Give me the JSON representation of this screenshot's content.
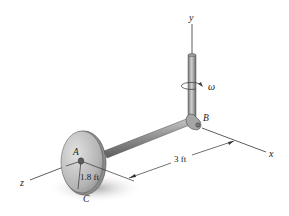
{
  "figure": {
    "type": "mechanics-diagram",
    "axes": {
      "x_label": "x",
      "y_label": "y",
      "z_label": "z"
    },
    "points": {
      "A": "A",
      "B": "B",
      "C": "C"
    },
    "angular_velocity_label": "ω",
    "dimensions": {
      "rod_length": "3 ft",
      "disk_radius": "1.8 ft"
    },
    "colors": {
      "metal_light": "#c8c8c8",
      "metal_mid": "#9a9a9a",
      "metal_dark": "#6e6e6e",
      "shadow": "#bdbdbd",
      "line": "#333333",
      "background": "#ffffff"
    }
  }
}
